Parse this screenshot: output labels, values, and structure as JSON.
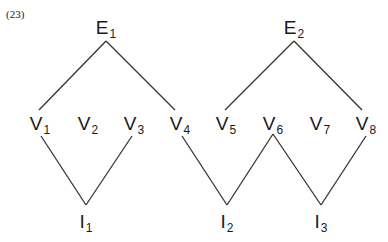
{
  "example_number": "(23)",
  "nodes": {
    "E1": {
      "letter": "E",
      "sub": "1",
      "x": 106,
      "y": 18
    },
    "E2": {
      "letter": "E",
      "sub": "2",
      "x": 294,
      "y": 18
    },
    "V1": {
      "letter": "V",
      "sub": "1",
      "x": 40,
      "y": 114
    },
    "V2": {
      "letter": "V",
      "sub": "2",
      "x": 88,
      "y": 114
    },
    "V3": {
      "letter": "V",
      "sub": "3",
      "x": 134,
      "y": 114
    },
    "V4": {
      "letter": "V",
      "sub": "4",
      "x": 180,
      "y": 114
    },
    "V5": {
      "letter": "V",
      "sub": "5",
      "x": 226,
      "y": 114
    },
    "V6": {
      "letter": "V",
      "sub": "6",
      "x": 273,
      "y": 114
    },
    "V7": {
      "letter": "V",
      "sub": "7",
      "x": 320,
      "y": 114
    },
    "V8": {
      "letter": "V",
      "sub": "8",
      "x": 366,
      "y": 114
    },
    "I1": {
      "letter": "I",
      "sub": "1",
      "x": 86,
      "y": 212
    },
    "I2": {
      "letter": "I",
      "sub": "2",
      "x": 227,
      "y": 212
    },
    "I3": {
      "letter": "I",
      "sub": "3",
      "x": 321,
      "y": 212
    }
  },
  "edges": [
    {
      "from": "E1",
      "to": "V1",
      "x1": 106,
      "y1": 41,
      "x2": 39,
      "y2": 110
    },
    {
      "from": "E1",
      "to": "V4",
      "x1": 106,
      "y1": 41,
      "x2": 175,
      "y2": 110
    },
    {
      "from": "E2",
      "to": "V5",
      "x1": 294,
      "y1": 41,
      "x2": 225,
      "y2": 110
    },
    {
      "from": "E2",
      "to": "V8",
      "x1": 294,
      "y1": 41,
      "x2": 362,
      "y2": 110
    },
    {
      "from": "V1",
      "to": "I1",
      "x1": 41,
      "y1": 136,
      "x2": 86,
      "y2": 205
    },
    {
      "from": "V3",
      "to": "I1",
      "x1": 132,
      "y1": 136,
      "x2": 86,
      "y2": 205
    },
    {
      "from": "V4",
      "to": "I2",
      "x1": 182,
      "y1": 136,
      "x2": 227,
      "y2": 205
    },
    {
      "from": "V6",
      "to": "I2",
      "x1": 273,
      "y1": 134,
      "x2": 227,
      "y2": 205
    },
    {
      "from": "V6",
      "to": "I3",
      "x1": 273,
      "y1": 134,
      "x2": 321,
      "y2": 205
    },
    {
      "from": "V8",
      "to": "I3",
      "x1": 366,
      "y1": 136,
      "x2": 321,
      "y2": 205
    }
  ]
}
